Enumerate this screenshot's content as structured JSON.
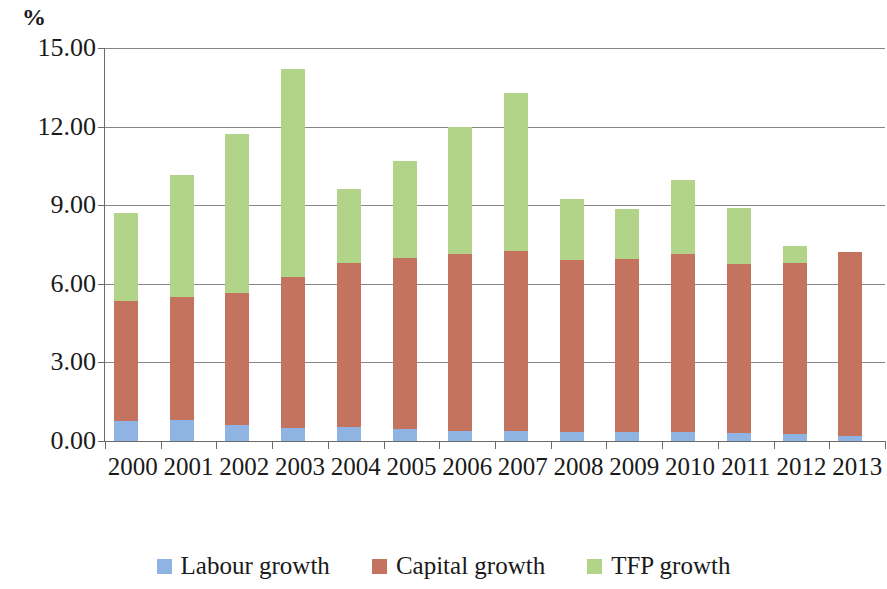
{
  "axis_unit_label": "%",
  "colors": {
    "labour": "#8FB4E3",
    "capital": "#C4735F",
    "tfp": "#B2D489",
    "gridline": "#868686",
    "axis": "#6b6b6b",
    "text": "#1a1a1a"
  },
  "legend": {
    "items": [
      {
        "label": "Labour growth",
        "color": "#8FB4E3",
        "key": "labour"
      },
      {
        "label": "Capital growth",
        "color": "#C4735F",
        "key": "capital"
      },
      {
        "label": "TFP growth",
        "color": "#B2D489",
        "key": "tfp"
      }
    ]
  },
  "y_axis": {
    "ticks": [
      "15.00",
      "12.00",
      "9.00",
      "6.00",
      "3.00",
      "0.00"
    ],
    "min": 0,
    "max": 15,
    "step": 3
  },
  "chart_data": {
    "type": "bar",
    "stacked": true,
    "title": "",
    "subtitle": "",
    "xlabel": "",
    "ylabel": "%",
    "ylim": [
      0,
      15
    ],
    "ytick_step": 3,
    "grid": true,
    "legend_position": "bottom",
    "categories": [
      "2000",
      "2001",
      "2002",
      "2003",
      "2004",
      "2005",
      "2006",
      "2007",
      "2008",
      "2009",
      "2010",
      "2011",
      "2012",
      "2013"
    ],
    "series": [
      {
        "name": "Labour growth",
        "color": "#8FB4E3",
        "values": [
          0.77,
          0.8,
          0.6,
          0.5,
          0.55,
          0.45,
          0.4,
          0.4,
          0.35,
          0.35,
          0.35,
          0.3,
          0.25,
          0.2
        ]
      },
      {
        "name": "Capital growth",
        "color": "#C4735F",
        "values": [
          4.58,
          4.7,
          5.05,
          5.75,
          6.25,
          6.55,
          6.75,
          6.85,
          6.55,
          6.6,
          6.8,
          6.45,
          6.55,
          7.0
        ]
      },
      {
        "name": "TFP growth",
        "color": "#B2D489",
        "values": [
          3.35,
          4.65,
          6.05,
          7.95,
          2.8,
          3.7,
          4.85,
          6.05,
          2.35,
          1.9,
          2.8,
          2.15,
          0.65,
          0.0
        ]
      }
    ],
    "totals": [
      8.7,
      10.15,
      11.7,
      14.2,
      9.6,
      10.7,
      12.0,
      13.3,
      9.25,
      8.85,
      9.95,
      8.9,
      7.45,
      7.2
    ]
  }
}
